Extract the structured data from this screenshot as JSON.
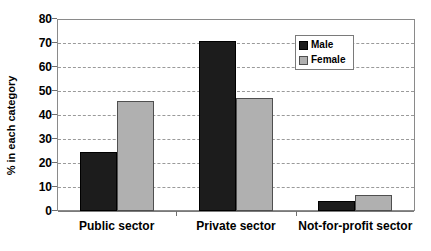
{
  "chart_data": {
    "type": "bar",
    "title": "",
    "subtitle": "",
    "xlabel": "",
    "ylabel": "% in each category",
    "categories": [
      "Public sector",
      "Private sector",
      "Not-for-profit sector"
    ],
    "series": [
      {
        "name": "Male",
        "color": "#1c1c1c",
        "values": [
          24.5,
          71,
          4
        ]
      },
      {
        "name": "Female",
        "color": "#b0b0b0",
        "values": [
          46,
          47,
          6.5
        ]
      }
    ],
    "ylim": [
      0,
      80
    ],
    "ytick_step": 10,
    "ytick_labels": [
      "0",
      "10",
      "20",
      "30",
      "40",
      "50",
      "60",
      "70",
      "80"
    ],
    "grid": "horizontal-dashed",
    "legend_position": "top-right-inside",
    "legend_entries": [
      "Male",
      "Female"
    ],
    "plot_border": true
  }
}
